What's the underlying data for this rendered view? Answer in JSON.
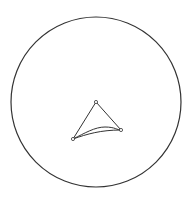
{
  "canvas": {
    "width": 191,
    "height": 203,
    "background": "#ffffff"
  },
  "diagram": {
    "stroke_color": "#333333",
    "circle": {
      "cx": 96,
      "cy": 102,
      "r": 85
    },
    "vertices": [
      {
        "id": "top",
        "x": 96,
        "y": 102
      },
      {
        "id": "right",
        "x": 121,
        "y": 130
      },
      {
        "id": "left",
        "x": 73,
        "y": 139
      }
    ],
    "edges": [
      {
        "from": "top",
        "to": "right",
        "type": "line"
      },
      {
        "from": "top",
        "to": "left",
        "type": "line"
      },
      {
        "from": "left",
        "to": "right",
        "type": "curve-upper"
      },
      {
        "from": "left",
        "to": "right",
        "type": "curve-lower"
      }
    ]
  }
}
